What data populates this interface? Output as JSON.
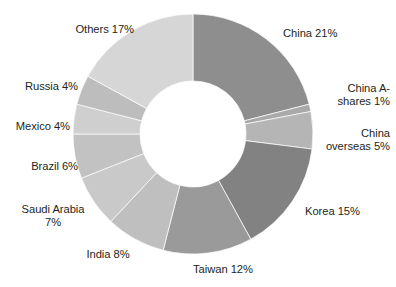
{
  "chart_data": {
    "type": "pie",
    "variant": "donut",
    "title": "",
    "subtitle": "",
    "xlabel": "",
    "ylabel": "",
    "legend": "none",
    "grid": false,
    "units": "%",
    "start_angle_deg": 0,
    "direction": "clockwise",
    "inner_radius_ratio": 0.44,
    "total": 100,
    "categories": [
      "China",
      "China A-shares",
      "China overseas",
      "Korea",
      "Taiwan",
      "India",
      "Saudi Arabia",
      "Brazil",
      "Mexico",
      "Russia",
      "Others"
    ],
    "values": [
      21,
      1,
      5,
      15,
      12,
      8,
      7,
      6,
      4,
      4,
      17
    ],
    "colors": [
      "#8e8e8e",
      "#a9a9a9",
      "#b5b5b5",
      "#828282",
      "#9a9a9a",
      "#bfbfbf",
      "#c9c9c9",
      "#c2c2c2",
      "#cfcfcf",
      "#bdbdbd",
      "#d6d6d6"
    ],
    "slices": [
      {
        "label": "China",
        "value": 21,
        "text": "China 21%",
        "color": "#8e8e8e"
      },
      {
        "label": "China A-shares",
        "value": 1,
        "text": "China A-\nshares 1%",
        "color": "#a9a9a9"
      },
      {
        "label": "China overseas",
        "value": 5,
        "text": "China\noverseas 5%",
        "color": "#b5b5b5"
      },
      {
        "label": "Korea",
        "value": 15,
        "text": "Korea 15%",
        "color": "#828282"
      },
      {
        "label": "Taiwan",
        "value": 12,
        "text": "Taiwan 12%",
        "color": "#9a9a9a"
      },
      {
        "label": "India",
        "value": 8,
        "text": "India 8%",
        "color": "#bfbfbf"
      },
      {
        "label": "Saudi Arabia",
        "value": 7,
        "text": "Saudi Arabia\n7%",
        "color": "#c9c9c9"
      },
      {
        "label": "Brazil",
        "value": 6,
        "text": "Brazil 6%",
        "color": "#c2c2c2"
      },
      {
        "label": "Mexico",
        "value": 4,
        "text": "Mexico 4%",
        "color": "#cfcfcf"
      },
      {
        "label": "Russia",
        "value": 4,
        "text": "Russia 4%",
        "color": "#bdbdbd"
      },
      {
        "label": "Others",
        "value": 17,
        "text": "Others 17%",
        "color": "#d6d6d6"
      }
    ],
    "geometry": {
      "center_x": 193,
      "center_y": 134,
      "outer_radius": 120,
      "inner_radius": 53
    },
    "background": "#ffffff",
    "label_color": "#231f20"
  }
}
